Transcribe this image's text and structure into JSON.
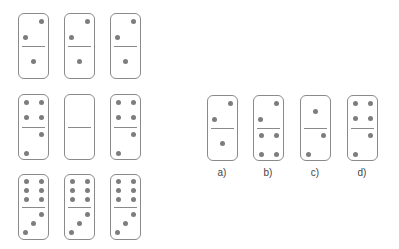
{
  "puzzle": {
    "grid": [
      [
        {
          "top": [
            [
              "TR"
            ],
            [
              "ML"
            ]
          ],
          "topPips": [
            "TR",
            "BL"
          ],
          "bottomPips": [
            "C"
          ]
        },
        {
          "topPips": [
            "TR",
            "BL"
          ],
          "bottomPips": [
            "C"
          ]
        },
        {
          "topPips": [
            "TR",
            "BL"
          ],
          "bottomPips": [
            "C"
          ]
        }
      ],
      [
        {
          "topPips": [
            "TL",
            "TR",
            "BL",
            "BR"
          ],
          "bottomPips": [
            "TR",
            "BL"
          ]
        },
        {
          "topPips": [],
          "bottomPips": [],
          "missing": true
        },
        {
          "topPips": [
            "TL",
            "TR",
            "BL",
            "BR"
          ],
          "bottomPips": [
            "TR",
            "BL"
          ]
        }
      ],
      [
        {
          "topPips": [
            "TL",
            "TR",
            "ML",
            "MR",
            "BL",
            "BR"
          ],
          "bottomPips": [
            "TR",
            "C",
            "BL"
          ]
        },
        {
          "topPips": [
            "TL",
            "TR",
            "ML",
            "MR",
            "BL",
            "BR"
          ],
          "bottomPips": [
            "TR",
            "C",
            "BL"
          ]
        },
        {
          "topPips": [
            "TL",
            "TR",
            "ML",
            "MR",
            "BL",
            "BR"
          ],
          "bottomPips": [
            "TR",
            "C",
            "BL"
          ]
        }
      ]
    ],
    "options": [
      {
        "label": "a)",
        "topPips": [
          "TR",
          "BL"
        ],
        "bottomPips": [
          "C"
        ]
      },
      {
        "label": "b)",
        "topPips": [
          "TR",
          "BL"
        ],
        "bottomPips": [
          "TL",
          "TR",
          "BL",
          "BR"
        ]
      },
      {
        "label": "c)",
        "topPips": [
          "C"
        ],
        "bottomPips": [
          "TR",
          "BL"
        ]
      },
      {
        "label": "d)",
        "topPips": [
          "TL",
          "TR",
          "BL",
          "BR"
        ],
        "bottomPips": [
          "TR",
          "BL"
        ]
      }
    ]
  },
  "colors": {
    "border": "#8a8a8a",
    "pip": "#7d7d7d",
    "text": "#444444"
  }
}
